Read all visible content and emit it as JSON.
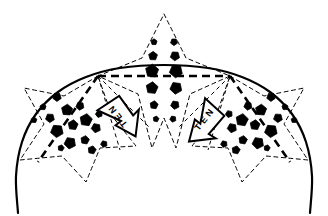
{
  "figure": {
    "name": "net-lobe-diagram",
    "background": "#ffffff",
    "ink": "#000000",
    "width": 328,
    "height": 216
  },
  "annotations": {
    "arrow_left_label": "NET",
    "arrow_right_label": "NET"
  },
  "chart_data": {
    "type": "scatter",
    "title": "",
    "xlabel": "",
    "ylabel": "",
    "xlim": [
      0,
      328
    ],
    "ylim": [
      0,
      216
    ],
    "grid": false,
    "legend": null,
    "solid_arc": {
      "name": "main-dome-arc",
      "style": "solid",
      "stroke": "#000000",
      "width": 2.2,
      "points": [
        [
          18,
          213
        ],
        [
          16,
          176
        ],
        [
          22,
          142
        ],
        [
          36,
          114
        ],
        [
          58,
          92
        ],
        [
          86,
          77
        ],
        [
          120,
          68
        ],
        [
          164,
          65
        ],
        [
          208,
          68
        ],
        [
          242,
          77
        ],
        [
          270,
          92
        ],
        [
          292,
          114
        ],
        [
          306,
          142
        ],
        [
          312,
          176
        ],
        [
          310,
          213
        ]
      ]
    },
    "nodes": [
      {
        "name": "node-left",
        "x": 98,
        "y": 76
      },
      {
        "name": "node-right",
        "x": 230,
        "y": 76
      },
      {
        "name": "node-base-left",
        "x": 38,
        "y": 162
      },
      {
        "name": "node-base-right",
        "x": 290,
        "y": 162
      },
      {
        "name": "node-apex",
        "x": 164,
        "y": 14
      },
      {
        "name": "node-mid-bottom",
        "x": 164,
        "y": 148
      }
    ],
    "dashed_chords": [
      {
        "name": "chord-horizontal",
        "from": [
          98,
          76
        ],
        "to": [
          230,
          76
        ],
        "style": "dashed-bold"
      },
      {
        "name": "chord-left-down",
        "from": [
          98,
          76
        ],
        "to": [
          38,
          162
        ],
        "style": "dashed-bold"
      },
      {
        "name": "chord-right-down",
        "from": [
          230,
          76
        ],
        "to": [
          290,
          162
        ],
        "style": "dashed-bold"
      },
      {
        "name": "chord-left-fan-a",
        "from": [
          98,
          76
        ],
        "to": [
          120,
          150
        ],
        "style": "dashed-thin"
      },
      {
        "name": "chord-left-fan-b",
        "from": [
          98,
          76
        ],
        "to": [
          150,
          128
        ],
        "style": "dashed-thin"
      },
      {
        "name": "chord-right-fan-a",
        "from": [
          230,
          76
        ],
        "to": [
          208,
          150
        ],
        "style": "dashed-thin"
      },
      {
        "name": "chord-right-fan-b",
        "from": [
          230,
          76
        ],
        "to": [
          178,
          128
        ],
        "style": "dashed-thin"
      }
    ],
    "lobes": [
      {
        "name": "lobe-left",
        "style": "dashed-thin",
        "outline": [
          [
            98,
            76
          ],
          [
            64,
            96
          ],
          [
            24,
            88
          ],
          [
            44,
            124
          ],
          [
            20,
            160
          ],
          [
            62,
            156
          ],
          [
            86,
            182
          ],
          [
            100,
            148
          ],
          [
            136,
            146
          ],
          [
            112,
            116
          ]
        ]
      },
      {
        "name": "lobe-center",
        "style": "dashed-thin",
        "outline": [
          [
            164,
            14
          ],
          [
            186,
            58
          ],
          [
            230,
            76
          ],
          [
            190,
            94
          ],
          [
            176,
            148
          ],
          [
            164,
            118
          ],
          [
            152,
            148
          ],
          [
            138,
            94
          ],
          [
            98,
            76
          ],
          [
            142,
            58
          ]
        ]
      },
      {
        "name": "lobe-right",
        "style": "dashed-thin",
        "outline": [
          [
            230,
            76
          ],
          [
            264,
            96
          ],
          [
            304,
            88
          ],
          [
            284,
            124
          ],
          [
            308,
            160
          ],
          [
            266,
            156
          ],
          [
            242,
            182
          ],
          [
            228,
            148
          ],
          [
            192,
            146
          ],
          [
            216,
            116
          ]
        ]
      }
    ],
    "markers": {
      "shape": "pentagon",
      "fill": "#000000",
      "series": [
        {
          "name": "cluster-left",
          "points": [
            {
              "x": 43,
              "y": 107,
              "r": 3.2
            },
            {
              "x": 57,
              "y": 97,
              "r": 4.4
            },
            {
              "x": 34,
              "y": 120,
              "r": 3.0
            },
            {
              "x": 50,
              "y": 118,
              "r": 4.6
            },
            {
              "x": 67,
              "y": 110,
              "r": 5.8
            },
            {
              "x": 57,
              "y": 131,
              "r": 6.6
            },
            {
              "x": 73,
              "y": 125,
              "r": 5.2
            },
            {
              "x": 80,
              "y": 106,
              "r": 4.2
            },
            {
              "x": 86,
              "y": 120,
              "r": 6.4
            },
            {
              "x": 70,
              "y": 143,
              "r": 6.0
            },
            {
              "x": 85,
              "y": 140,
              "r": 4.4
            },
            {
              "x": 96,
              "y": 128,
              "r": 4.8
            },
            {
              "x": 92,
              "y": 150,
              "r": 4.2
            },
            {
              "x": 104,
              "y": 144,
              "r": 3.4
            },
            {
              "x": 61,
              "y": 148,
              "r": 3.2
            },
            {
              "x": 99,
              "y": 114,
              "r": 3.6
            }
          ]
        },
        {
          "name": "cluster-center",
          "points": [
            {
              "x": 154,
              "y": 42,
              "r": 3.2
            },
            {
              "x": 174,
              "y": 42,
              "r": 3.6
            },
            {
              "x": 153,
              "y": 56,
              "r": 4.6
            },
            {
              "x": 175,
              "y": 56,
              "r": 4.8
            },
            {
              "x": 152,
              "y": 71,
              "r": 6.8
            },
            {
              "x": 176,
              "y": 71,
              "r": 6.8
            },
            {
              "x": 152,
              "y": 88,
              "r": 6.2
            },
            {
              "x": 176,
              "y": 88,
              "r": 6.2
            },
            {
              "x": 154,
              "y": 105,
              "r": 4.2
            },
            {
              "x": 175,
              "y": 105,
              "r": 4.4
            },
            {
              "x": 156,
              "y": 119,
              "r": 3.0
            },
            {
              "x": 173,
              "y": 119,
              "r": 3.2
            }
          ]
        },
        {
          "name": "cluster-right",
          "points": [
            {
              "x": 285,
              "y": 107,
              "r": 3.2
            },
            {
              "x": 271,
              "y": 97,
              "r": 4.4
            },
            {
              "x": 294,
              "y": 120,
              "r": 3.0
            },
            {
              "x": 278,
              "y": 118,
              "r": 4.6
            },
            {
              "x": 261,
              "y": 110,
              "r": 5.8
            },
            {
              "x": 271,
              "y": 131,
              "r": 6.6
            },
            {
              "x": 255,
              "y": 125,
              "r": 5.2
            },
            {
              "x": 248,
              "y": 106,
              "r": 4.2
            },
            {
              "x": 242,
              "y": 120,
              "r": 6.4
            },
            {
              "x": 258,
              "y": 143,
              "r": 6.0
            },
            {
              "x": 243,
              "y": 140,
              "r": 4.4
            },
            {
              "x": 232,
              "y": 128,
              "r": 4.8
            },
            {
              "x": 236,
              "y": 150,
              "r": 4.2
            },
            {
              "x": 224,
              "y": 144,
              "r": 3.4
            },
            {
              "x": 267,
              "y": 148,
              "r": 3.2
            },
            {
              "x": 229,
              "y": 114,
              "r": 3.6
            }
          ]
        }
      ]
    },
    "arrows": [
      {
        "name": "net-arrow-left",
        "label": "NET",
        "cx": 120,
        "cy": 118,
        "rotation": -38,
        "fill": "#ffffff",
        "stroke": "#000000"
      },
      {
        "name": "net-arrow-right",
        "label": "NET",
        "cx": 203,
        "cy": 122,
        "rotation": 38,
        "fill": "#ffffff",
        "stroke": "#000000"
      }
    ]
  }
}
